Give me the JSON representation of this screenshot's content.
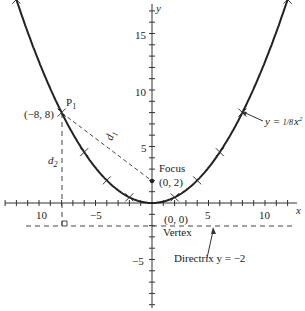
{
  "chart_data": {
    "type": "line",
    "title": "",
    "equation_label": "y = 1/8 x²",
    "xlabel": "x",
    "ylabel": "y",
    "xlim": [
      -13,
      13
    ],
    "ylim": [
      -8,
      18
    ],
    "x_tick_labels": [
      "10",
      "-5",
      "5",
      "10"
    ],
    "y_tick_labels": [
      "15",
      "10",
      "5",
      "-5"
    ],
    "series": [
      {
        "name": "y = x^2/8",
        "x": [
          -12,
          -8,
          -6,
          -4,
          -2,
          0,
          2,
          4,
          6,
          8,
          12
        ],
        "y": [
          18,
          8,
          4.5,
          2,
          0.5,
          0,
          0.5,
          2,
          4.5,
          8,
          18
        ]
      }
    ],
    "points": [
      {
        "name": "P1",
        "label": "(-8, 8)",
        "x": -8,
        "y": 8
      },
      {
        "name": "Focus",
        "label": "(0, 2)",
        "x": 0,
        "y": 2
      },
      {
        "name": "Vertex",
        "label": "(0, 0)",
        "x": 0,
        "y": 0
      }
    ],
    "directrix": {
      "label": "Directrix y = −2",
      "y": -2
    },
    "distances": [
      "d1",
      "d2"
    ]
  },
  "labels": {
    "p1": "P",
    "p1_sub": "1",
    "p1_coord": "(−8, 8)",
    "focus": "Focus",
    "focus_coord": "(0, 2)",
    "vertex_coord": "(0, 0)",
    "vertex": "Vertex",
    "directrix": "Directrix y = −2",
    "d1": "d",
    "d1_sub": "1",
    "d2": "d",
    "d2_sub": "2",
    "eq_y": "y = ",
    "eq_frac": "1/8",
    "eq_x": "x",
    "eq_sup": "2",
    "x_axis": "x",
    "y_axis": "y",
    "tick_x_neg10": "10",
    "tick_x_neg5": "−5",
    "tick_x_5": "5",
    "tick_x_10": "10",
    "tick_y_15": "15",
    "tick_y_10": "10",
    "tick_y_5": "5",
    "tick_y_neg5": "−5"
  }
}
